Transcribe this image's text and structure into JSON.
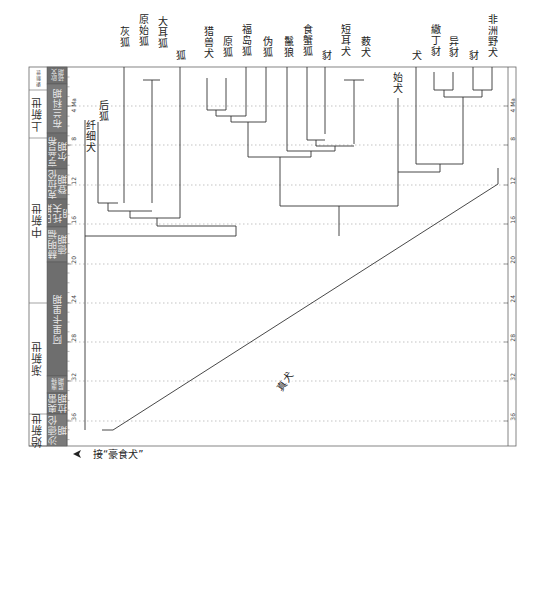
{
  "figure": {
    "colors": {
      "stage_fill": "#6e6e6e",
      "stage_fill_alt": "#7a7a7a",
      "line": "#333333",
      "grid": "#9a9a9a",
      "frame": "#555555",
      "stage_text": "#ececec"
    }
  },
  "timescale": {
    "unit_label": "Ma",
    "ticks": [
      {
        "ma": 4,
        "y": 106,
        "label": "4 Ma"
      },
      {
        "ma": 8,
        "y": 145,
        "label": "8"
      },
      {
        "ma": 12,
        "y": 185,
        "label": "12"
      },
      {
        "ma": 16,
        "y": 224,
        "label": "16"
      },
      {
        "ma": 20,
        "y": 264,
        "label": "20"
      },
      {
        "ma": 24,
        "y": 303,
        "label": "24"
      },
      {
        "ma": 28,
        "y": 342,
        "label": "28"
      },
      {
        "ma": 32,
        "y": 381,
        "label": "32"
      },
      {
        "ma": 36,
        "y": 421,
        "label": "36"
      }
    ],
    "epochs": [
      {
        "label": "更新世",
        "y1": 67,
        "y2": 90,
        "small": true
      },
      {
        "label": "上新世",
        "y1": 90,
        "y2": 138
      },
      {
        "label": "中新世",
        "y1": 138,
        "y2": 303
      },
      {
        "label": "渐新世",
        "y1": 303,
        "y2": 414
      },
      {
        "label": "始新世",
        "y1": 414,
        "y2": 446
      }
    ],
    "stages": [
      {
        "label": "欧文顿期",
        "y1": 67,
        "y2": 84
      },
      {
        "label": "布兰科期",
        "y1": 84,
        "y2": 133
      },
      {
        "label": "亨普希尔期",
        "y1": 133,
        "y2": 169
      },
      {
        "label": "克拉伦登期",
        "y1": 169,
        "y2": 199
      },
      {
        "label": "巴斯托夫期",
        "y1": 199,
        "y2": 227
      },
      {
        "label": "赫明福德期",
        "y1": 227,
        "y2": 262
      },
      {
        "label": "阿里卡里期",
        "y1": 262,
        "y2": 376
      },
      {
        "label": "惠特尼期",
        "y1": 376,
        "y2": 393
      },
      {
        "label": "奥雷拉期",
        "y1": 393,
        "y2": 414
      },
      {
        "label": "沙德伦期",
        "y1": 414,
        "y2": 446
      }
    ]
  },
  "tree": {
    "taxa": [
      {
        "name": "灰狐",
        "x": 124,
        "tip_y": 67,
        "base_y": 200
      },
      {
        "name": "原始狐",
        "x": 143,
        "tip_y": 67,
        "base_y": 80
      },
      {
        "name": "大耳狐",
        "x": 160,
        "tip_y": 67,
        "base_y": 80
      },
      {
        "name": "狐",
        "x": 180,
        "tip_y": 67,
        "base_y": 193
      },
      {
        "name": "猎兽犬",
        "x": 207,
        "tip_y": 78,
        "base_y": 110
      },
      {
        "name": "原狐",
        "x": 226,
        "tip_y": 78,
        "base_y": 116
      },
      {
        "name": "福岛狐",
        "x": 246,
        "tip_y": 67,
        "base_y": 110
      },
      {
        "name": "伪狐",
        "x": 266,
        "tip_y": 67,
        "base_y": 116
      },
      {
        "name": "鬣狼",
        "x": 287,
        "tip_y": 67,
        "base_y": 130
      },
      {
        "name": "食蟹狐",
        "x": 307,
        "tip_y": 67,
        "base_y": 140
      },
      {
        "name": "豺",
        "x": 325,
        "tip_y": 67,
        "base_y": 134
      },
      {
        "name": "短耳犬",
        "x": 344,
        "tip_y": 70,
        "base_y": 80
      },
      {
        "name": "薮犬",
        "x": 364,
        "tip_y": 70,
        "base_y": 80
      },
      {
        "name": "始犬",
        "x": 398,
        "tip_y": 98,
        "base_y": 206
      },
      {
        "name": "犬",
        "x": 416,
        "tip_y": 67,
        "base_y": 147
      },
      {
        "name": "繖丁豺",
        "x": 434,
        "tip_y": 72,
        "base_y": 90
      },
      {
        "name": "异豺",
        "x": 453,
        "tip_y": 72,
        "base_y": 90
      },
      {
        "name": "豺2",
        "display": "豺",
        "x": 473,
        "tip_y": 67,
        "base_y": 90
      },
      {
        "name": "非洲野犬",
        "x": 492,
        "tip_y": 67,
        "base_y": 90
      }
    ],
    "top_labels": [
      {
        "text": "灰狐",
        "x": 118,
        "y": 26
      },
      {
        "text": "原始狐",
        "x": 137,
        "y": 14
      },
      {
        "text": "大耳狐",
        "x": 156,
        "y": 16
      },
      {
        "text": "狐",
        "x": 174,
        "y": 50
      },
      {
        "text": "猎兽犬",
        "x": 202,
        "y": 26
      },
      {
        "text": "原狐",
        "x": 221,
        "y": 36
      },
      {
        "text": "福岛狐",
        "x": 240,
        "y": 24
      },
      {
        "text": "伪狐",
        "x": 261,
        "y": 36
      },
      {
        "text": "鬣狼",
        "x": 282,
        "y": 36
      },
      {
        "text": "食蟹狐",
        "x": 301,
        "y": 24
      },
      {
        "text": "豺",
        "x": 320,
        "y": 50
      },
      {
        "text": "短耳犬",
        "x": 339,
        "y": 24
      },
      {
        "text": "薮犬",
        "x": 359,
        "y": 36
      },
      {
        "text": "始犬",
        "x": 391,
        "y": 72
      },
      {
        "text": "犬",
        "x": 410,
        "y": 50
      },
      {
        "text": "繖丁豺",
        "x": 429,
        "y": 24
      },
      {
        "text": "异豺",
        "x": 447,
        "y": 36
      },
      {
        "text": "豺",
        "x": 467,
        "y": 50
      },
      {
        "text": "非洲野犬",
        "x": 486,
        "y": 14
      }
    ],
    "inner_labels": [
      {
        "text": "后狐",
        "x": 97,
        "y": 100
      },
      {
        "text": "纤细犬",
        "x": 84,
        "y": 120
      },
      {
        "text": "真犬",
        "x": 274,
        "y": 376
      }
    ],
    "annotation": {
      "text": "接“豪食犬”",
      "x": 93,
      "y": 453,
      "arrow_x": 79,
      "arrow_y": 454
    },
    "segments": [
      [
        143,
        80,
        160,
        80
      ],
      [
        152,
        80,
        152,
        203
      ],
      [
        98,
        122,
        98,
        203
      ],
      [
        98,
        203,
        118,
        203
      ],
      [
        108,
        203,
        108,
        211
      ],
      [
        108,
        211,
        152,
        211
      ],
      [
        124,
        67,
        124,
        203
      ],
      [
        130,
        211,
        130,
        218
      ],
      [
        130,
        218,
        180,
        218
      ],
      [
        180,
        67,
        180,
        218
      ],
      [
        157,
        218,
        157,
        226
      ],
      [
        157,
        226,
        236,
        226
      ],
      [
        236,
        226,
        236,
        236
      ],
      [
        85,
        236,
        236,
        236
      ],
      [
        207,
        110,
        226,
        110
      ],
      [
        216,
        110,
        216,
        116
      ],
      [
        216,
        116,
        246,
        116
      ],
      [
        246,
        67,
        246,
        116
      ],
      [
        226,
        78,
        226,
        110
      ],
      [
        207,
        78,
        207,
        110
      ],
      [
        231,
        116,
        231,
        122
      ],
      [
        231,
        122,
        266,
        122
      ],
      [
        266,
        67,
        266,
        122
      ],
      [
        248,
        122,
        248,
        157
      ],
      [
        307,
        67,
        307,
        140
      ],
      [
        325,
        67,
        325,
        134
      ],
      [
        307,
        140,
        325,
        140
      ],
      [
        316,
        140,
        316,
        146
      ],
      [
        344,
        80,
        364,
        80
      ],
      [
        354,
        80,
        354,
        144
      ],
      [
        316,
        146,
        354,
        146
      ],
      [
        335,
        146,
        335,
        151
      ],
      [
        287,
        67,
        287,
        151
      ],
      [
        287,
        151,
        335,
        151
      ],
      [
        311,
        151,
        311,
        157
      ],
      [
        248,
        157,
        311,
        157
      ],
      [
        280,
        157,
        280,
        206
      ],
      [
        398,
        98,
        398,
        206
      ],
      [
        280,
        206,
        398,
        206
      ],
      [
        339,
        206,
        339,
        236
      ],
      [
        434,
        72,
        434,
        90
      ],
      [
        453,
        72,
        453,
        90
      ],
      [
        434,
        90,
        453,
        90
      ],
      [
        444,
        90,
        444,
        97
      ],
      [
        473,
        67,
        473,
        90
      ],
      [
        492,
        67,
        492,
        90
      ],
      [
        473,
        90,
        492,
        90
      ],
      [
        482,
        90,
        482,
        97
      ],
      [
        444,
        97,
        482,
        97
      ],
      [
        463,
        97,
        463,
        164
      ],
      [
        416,
        67,
        416,
        164
      ],
      [
        416,
        164,
        463,
        164
      ],
      [
        440,
        164,
        440,
        172
      ],
      [
        398,
        172,
        440,
        172
      ],
      [
        85,
        120,
        85,
        430
      ],
      [
        102,
        430,
        113,
        430
      ],
      [
        113,
        430,
        498,
        184
      ],
      [
        498,
        184,
        498,
        168
      ]
    ]
  }
}
